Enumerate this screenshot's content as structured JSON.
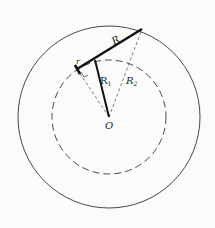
{
  "diagram": {
    "labels": {
      "R": "R",
      "r": "r",
      "R1": "R",
      "R1_sub": "1",
      "R2": "R",
      "R2_sub": "2",
      "O": "O"
    },
    "colors": {
      "line": "#222222",
      "background": "#fbfbf9"
    }
  }
}
